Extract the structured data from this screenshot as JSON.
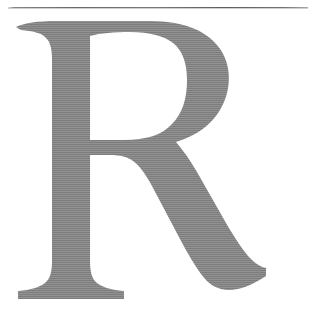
{
  "page": {
    "background_color": "#ffffff",
    "width": 310,
    "height": 312
  },
  "rule": {
    "name": "horizontal-rule",
    "color": "#555555",
    "thickness_px": 1
  },
  "dropcap": {
    "character": "R",
    "color": "#7d7d7d",
    "typeface_style": "serif",
    "label": "R"
  },
  "texture": {
    "kind": "scan-lines"
  }
}
